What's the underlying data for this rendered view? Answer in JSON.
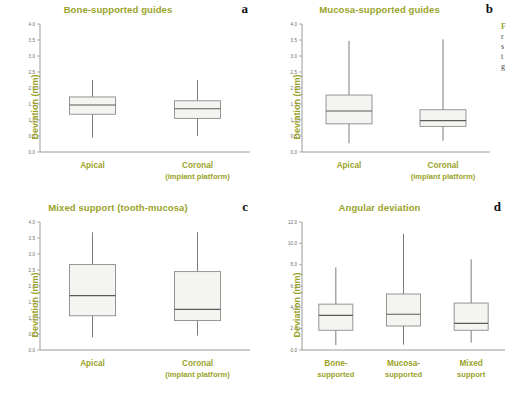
{
  "figure": {
    "background": "#ffffff",
    "title_color": "#9aa32a",
    "box_fill": "#f4f4f0",
    "box_stroke": "#8a8a8a"
  },
  "side_caption": {
    "line1": "F",
    "line2": "r",
    "line3": "s",
    "line4": "t",
    "line5": "g"
  },
  "panels": [
    {
      "letter": "a",
      "title": "Bone-supported guides",
      "ylabel": "Deviation (mm)",
      "categories": [
        "Apical",
        "Coronal"
      ],
      "sublabels": [
        "",
        "(implant platform)"
      ]
    },
    {
      "letter": "b",
      "title": "Mucosa-supported guides",
      "ylabel": "Deviation (mm)",
      "categories": [
        "Apical",
        "Coronal"
      ],
      "sublabels": [
        "",
        "(implant platform)"
      ]
    },
    {
      "letter": "c",
      "title": "Mixed support (tooth-mucosa)",
      "ylabel": "Deviation (mm)",
      "categories": [
        "Apical",
        "Coronal"
      ],
      "sublabels": [
        "",
        "(implant platform)"
      ]
    },
    {
      "letter": "d",
      "title": "Angular deviation",
      "ylabel": "Deviation (mm)",
      "categories": [
        "Bone-",
        "Mucosa-",
        "Mixed"
      ],
      "sublabels": [
        "supported",
        "supported",
        "support"
      ]
    }
  ],
  "chart_data": [
    {
      "type": "box",
      "panel": "a",
      "title": "Bone-supported guides",
      "xlabel": "",
      "ylabel": "Deviation (mm)",
      "ylim": [
        0.0,
        4.0
      ],
      "yticks": [
        "0.0",
        "0.5",
        "1.0",
        "1.5",
        "2.0",
        "2.5",
        "3.0",
        "3.5",
        "4.0"
      ],
      "categories": [
        "Apical",
        "Coronal (implant platform)"
      ],
      "boxes": [
        {
          "label": "Apical",
          "min": 0.45,
          "q1": 1.18,
          "median": 1.47,
          "q3": 1.72,
          "max": 2.25
        },
        {
          "label": "Coronal (implant platform)",
          "min": 0.5,
          "q1": 1.05,
          "median": 1.35,
          "q3": 1.6,
          "max": 2.25
        }
      ]
    },
    {
      "type": "box",
      "panel": "b",
      "title": "Mucosa-supported guides",
      "xlabel": "",
      "ylabel": "Deviation (mm)",
      "ylim": [
        0.0,
        4.0
      ],
      "yticks": [
        "0.0",
        "0.5",
        "1.0",
        "1.5",
        "2.0",
        "2.5",
        "3.0",
        "3.5",
        "4.0"
      ],
      "categories": [
        "Apical",
        "Coronal (implant platform)"
      ],
      "boxes": [
        {
          "label": "Apical",
          "min": 0.27,
          "q1": 0.88,
          "median": 1.28,
          "q3": 1.78,
          "max": 3.47
        },
        {
          "label": "Coronal (implant platform)",
          "min": 0.35,
          "q1": 0.8,
          "median": 0.98,
          "q3": 1.32,
          "max": 3.52
        }
      ]
    },
    {
      "type": "box",
      "panel": "c",
      "title": "Mixed support (tooth-mucosa)",
      "xlabel": "",
      "ylabel": "Deviation (mm)",
      "ylim": [
        0.0,
        4.0
      ],
      "yticks": [
        "0.0",
        "0.5",
        "1.0",
        "1.5",
        "2.0",
        "2.5",
        "3.0",
        "3.5",
        "4.0"
      ],
      "categories": [
        "Apical",
        "Coronal (implant platform)"
      ],
      "boxes": [
        {
          "label": "Apical",
          "min": 0.4,
          "q1": 1.07,
          "median": 1.7,
          "q3": 2.67,
          "max": 3.68
        },
        {
          "label": "Coronal (implant platform)",
          "min": 0.45,
          "q1": 0.92,
          "median": 1.27,
          "q3": 2.45,
          "max": 3.68
        }
      ]
    },
    {
      "type": "box",
      "panel": "d",
      "title": "Angular deviation",
      "xlabel": "",
      "ylabel": "Deviation (mm)",
      "ylim": [
        0.0,
        12.0
      ],
      "yticks": [
        "0.0",
        "2.0",
        "4.0",
        "6.0",
        "8.0",
        "10.0",
        "12.0"
      ],
      "categories": [
        "Bone- supported",
        "Mucosa- supported",
        "Mixed support"
      ],
      "boxes": [
        {
          "label": "Bone- supported",
          "min": 0.45,
          "q1": 1.85,
          "median": 3.25,
          "q3": 4.3,
          "max": 7.75
        },
        {
          "label": "Mucosa- supported",
          "min": 0.5,
          "q1": 2.25,
          "median": 3.35,
          "q3": 5.25,
          "max": 10.9
        },
        {
          "label": "Mixed support",
          "min": 0.7,
          "q1": 1.85,
          "median": 2.5,
          "q3": 4.4,
          "max": 8.5
        }
      ]
    }
  ]
}
